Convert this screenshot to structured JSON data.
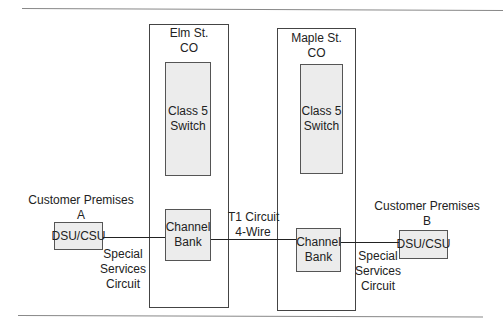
{
  "diagram": {
    "central_offices": [
      {
        "name_line1": "Elm St.",
        "name_line2": "CO",
        "switch_line1": "Class 5",
        "switch_line2": "Switch",
        "bank_line1": "Channel",
        "bank_line2": "Bank"
      },
      {
        "name_line1": "Maple St.",
        "name_line2": "CO",
        "switch_line1": "Class 5",
        "switch_line2": "Switch",
        "bank_line1": "Channel",
        "bank_line2": "Bank"
      }
    ],
    "customer_a": {
      "line1": "Customer Premises",
      "line2": "A",
      "device": "DSU/CSU"
    },
    "customer_b": {
      "line1": "Customer Premises",
      "line2": "B",
      "device": "DSU/CSU"
    },
    "link_left": {
      "line1": "Special",
      "line2": "Services",
      "line3": "Circuit"
    },
    "link_middle": {
      "line1": "T1 Circuit",
      "line2": "4-Wire"
    },
    "link_right": {
      "line1": "Special",
      "line2": "Services",
      "line3": "Circuit"
    }
  }
}
